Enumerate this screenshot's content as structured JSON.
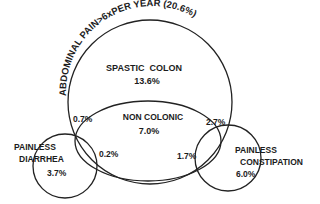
{
  "diagram": {
    "type": "venn",
    "outer_label": "ABDOMINAL PAIN>6xPER YEAR (20.6%)",
    "regions": {
      "spastic_colon": {
        "label": "SPASTIC  COLON",
        "value": "13.6%"
      },
      "non_colonic": {
        "label": "NON COLONIC",
        "value": "7.0%"
      },
      "painless_diarrhea": {
        "label_line1": "PAINLESS",
        "label_line2": "DIARRHEA",
        "value": "3.7%"
      },
      "painless_constipation": {
        "label_line1": "PAINLESS",
        "label_line2": "CONSTIPATION",
        "value": "6.0%"
      }
    },
    "overlaps": {
      "pain_diarrhea_outer": "0.7%",
      "noncolonic_diarrhea": "0.2%",
      "pain_constipation_outer": "2.7%",
      "noncolonic_constipation": "1.7%"
    },
    "colors": {
      "stroke": "#222222",
      "text": "#1c1c1c",
      "background": "#ffffff"
    }
  }
}
